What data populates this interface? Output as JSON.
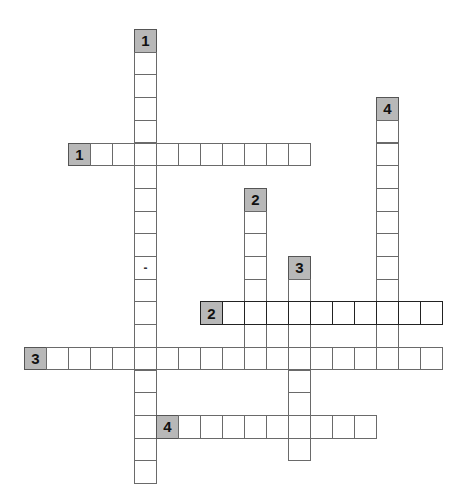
{
  "puzzle": {
    "grid": {
      "origin_x": 24,
      "origin_y": 29,
      "cell_w": 22,
      "cell_h": 22.7,
      "col_offset": -2
    },
    "colors": {
      "number_cell": "#b8b8b8",
      "border": "#6a6a6a",
      "bold_border": "#222222"
    },
    "entries": [
      {
        "id": "1-down",
        "number": "1",
        "direction": "down",
        "row": 0,
        "col": 3,
        "length": 20,
        "special": {
          "10": "-"
        }
      },
      {
        "id": "1-across",
        "number": "1",
        "direction": "across",
        "row": 5,
        "col": 0,
        "length": 11
      },
      {
        "id": "2-down",
        "number": "2",
        "direction": "down",
        "row": 7,
        "col": 8,
        "length": 8
      },
      {
        "id": "3-down",
        "number": "3",
        "direction": "down",
        "row": 10,
        "col": 10,
        "length": 9
      },
      {
        "id": "4-down",
        "number": "4",
        "direction": "down",
        "row": 3,
        "col": 14,
        "length": 12
      },
      {
        "id": "2-across",
        "number": "2",
        "direction": "across",
        "row": 12,
        "col": 6,
        "length": 11,
        "highlighted": true
      },
      {
        "id": "3-across",
        "number": "3",
        "direction": "across",
        "row": 14,
        "col": -2,
        "length": 19
      },
      {
        "id": "4-across",
        "number": "4",
        "direction": "across",
        "row": 17,
        "col": 4,
        "length": 10
      }
    ]
  }
}
